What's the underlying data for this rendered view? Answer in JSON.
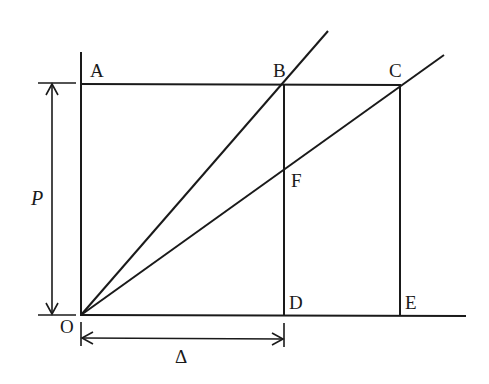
{
  "diagram": {
    "type": "geometric load-deflection construction",
    "labels": {
      "A": "A",
      "B": "B",
      "C": "C",
      "D": "D",
      "E": "E",
      "F": "F",
      "O": "O",
      "P": "P",
      "delta": "Δ"
    },
    "points": {
      "O": [
        81,
        315
      ],
      "A": [
        81,
        84
      ],
      "B": [
        284,
        84
      ],
      "C": [
        400,
        84
      ],
      "D": [
        284,
        315
      ],
      "E": [
        400,
        315
      ],
      "F": [
        284,
        168
      ]
    },
    "lines": [
      {
        "name": "vertical-axis",
        "from": [
          81,
          52
        ],
        "to": [
          81,
          315
        ]
      },
      {
        "name": "horizontal-axis",
        "from": [
          81,
          315
        ],
        "to": [
          466,
          315
        ]
      },
      {
        "name": "top-line-AC",
        "from": [
          81,
          84
        ],
        "to": [
          401,
          84
        ]
      },
      {
        "name": "line-BD",
        "from": [
          284,
          84
        ],
        "to": [
          284,
          315
        ]
      },
      {
        "name": "line-CE",
        "from": [
          400,
          84
        ],
        "to": [
          400,
          315
        ]
      },
      {
        "name": "ray-OB",
        "from": [
          81,
          315
        ],
        "to": [
          328,
          30
        ]
      },
      {
        "name": "ray-OC",
        "from": [
          81,
          315
        ],
        "to": [
          444,
          54
        ]
      }
    ],
    "dimensions": {
      "P": {
        "axis": "vertical",
        "x": 52,
        "from_y": 84,
        "to_y": 315,
        "label": "P"
      },
      "delta": {
        "axis": "horizontal",
        "y": 338,
        "from_x": 81,
        "to_x": 284,
        "label": "Δ"
      }
    },
    "colors": {
      "stroke": "#1a1a1a",
      "background": "#ffffff"
    }
  }
}
